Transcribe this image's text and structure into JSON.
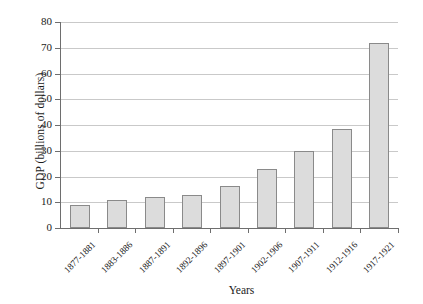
{
  "chart_data": {
    "type": "bar",
    "title": "",
    "xlabel": "Years",
    "ylabel": "GDP (billions of dollars)",
    "categories": [
      "1877-1881",
      "1883-1886",
      "1887-1891",
      "1892-1896",
      "1897-1901",
      "1902-1906",
      "1907-1911",
      "1912-1916",
      "1917-1921"
    ],
    "values": [
      9,
      11,
      12,
      13,
      16.5,
      23,
      30,
      38.5,
      72
    ],
    "ylim": [
      0,
      80
    ],
    "yticks": [
      0,
      10,
      20,
      30,
      40,
      50,
      60,
      70,
      80
    ],
    "ytick_labels": [
      "0",
      "10",
      "20",
      "30",
      "40",
      "50",
      "60",
      "70",
      "80"
    ],
    "grid": true,
    "legend": false,
    "bar_fill_color": "#dcdcdc",
    "bar_edge_color": "#8a8a8a",
    "gridline_color": "#c9c9c9",
    "axis_color": "#6e6e6e"
  }
}
